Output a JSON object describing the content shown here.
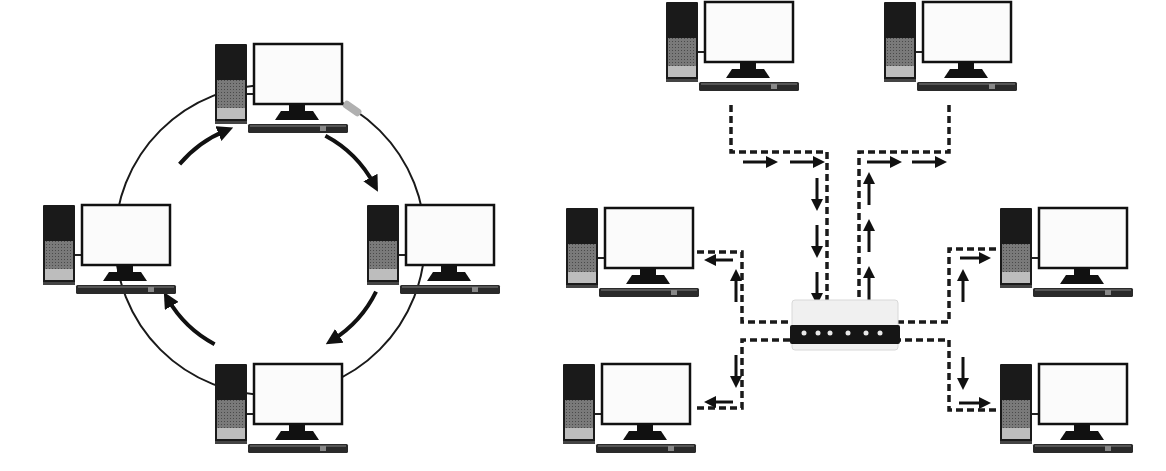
{
  "diagram": {
    "title": "Ring topology vs Star topology",
    "colors": {
      "ink": "#111111",
      "tower_top": "#1a1a1a",
      "tower_mid": "#6e6e6e",
      "tower_bottom": "#bdbdbd",
      "screen": "#fbfbfb",
      "cable": "#1a1a1a",
      "connector": "#b0b0b0",
      "switch_body": "#f0f0f0",
      "switch_panel": "#151515",
      "switch_led": "#e8e8e8"
    },
    "ring": {
      "label": "Ring network",
      "computers": [
        {
          "id": "ring-top",
          "label": "Computer (top)"
        },
        {
          "id": "ring-right",
          "label": "Computer (right)"
        },
        {
          "id": "ring-bottom",
          "label": "Computer (bottom)"
        },
        {
          "id": "ring-left",
          "label": "Computer (left)"
        }
      ],
      "flow_direction": "clockwise",
      "arrow_count": 4
    },
    "star": {
      "label": "Star network",
      "hub_label": "Switch / hub",
      "hub_led_count": 6,
      "computers": [
        {
          "id": "star-top-left",
          "label": "Computer (top-left)",
          "flow": "to-hub"
        },
        {
          "id": "star-top-right",
          "label": "Computer (top-right)",
          "flow": "from-hub"
        },
        {
          "id": "star-mid-left",
          "label": "Computer (middle-left)",
          "flow": "from-hub"
        },
        {
          "id": "star-mid-right",
          "label": "Computer (middle-right)",
          "flow": "from-hub"
        },
        {
          "id": "star-bottom-left",
          "label": "Computer (bottom-left)",
          "flow": "from-hub"
        },
        {
          "id": "star-bottom-right",
          "label": "Computer (bottom-right)",
          "flow": "from-hub"
        }
      ]
    }
  }
}
